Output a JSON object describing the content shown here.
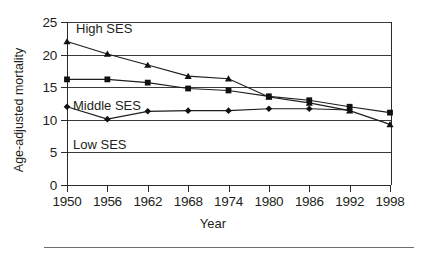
{
  "figure": {
    "xlabel": "Year",
    "ylabel": "Age-adjusted mortality"
  },
  "annotations": {
    "high": "High SES",
    "middle": "Middle SES",
    "low": "Low SES"
  },
  "axes": {
    "y_ticks": [
      "25",
      "20",
      "15",
      "10",
      "5",
      "0"
    ],
    "x_ticks": [
      "1950",
      "1956",
      "1962",
      "1968",
      "1974",
      "1980",
      "1986",
      "1992",
      "1998"
    ]
  },
  "chart_data": {
    "type": "line",
    "title": "",
    "xlabel": "Year",
    "ylabel": "Age-adjusted mortality",
    "x": [
      1950,
      1956,
      1962,
      1968,
      1974,
      1980,
      1986,
      1992,
      1998
    ],
    "xlim": [
      1950,
      1998
    ],
    "ylim": [
      0,
      25
    ],
    "ytick_values": [
      0,
      5,
      10,
      15,
      20,
      25
    ],
    "grid": "horizontal",
    "legend": "inline-annotations",
    "series": [
      {
        "name": "High SES",
        "marker": "triangle",
        "values": [
          22.0,
          20.1,
          18.4,
          16.7,
          16.3,
          13.5,
          12.6,
          11.4,
          9.3
        ]
      },
      {
        "name": "Middle SES",
        "marker": "square",
        "values": [
          16.2,
          16.2,
          15.7,
          14.8,
          14.5,
          13.6,
          13.0,
          12.0,
          11.1
        ]
      },
      {
        "name": "Low SES",
        "marker": "diamond",
        "values": [
          12.0,
          10.1,
          11.3,
          11.4,
          11.4,
          11.7,
          11.7,
          11.5,
          null
        ]
      }
    ]
  }
}
